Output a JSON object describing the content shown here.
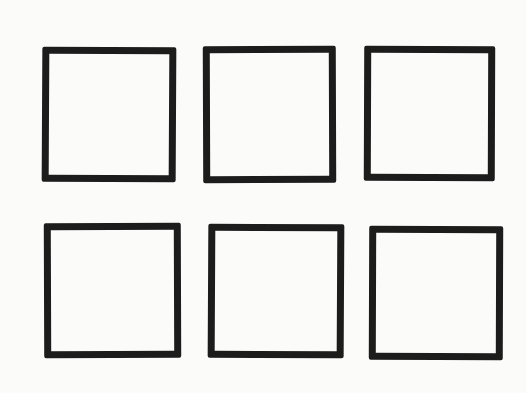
{
  "diagram": {
    "stroke_color": "#1c1c1c",
    "background_color": "#fbfbf9",
    "rows": 2,
    "columns": 3,
    "boxes": [
      {
        "row": 1,
        "col": 1,
        "x": 42,
        "y": 47,
        "w": 134,
        "h": 135
      },
      {
        "row": 1,
        "col": 2,
        "x": 203,
        "y": 46,
        "w": 133,
        "h": 137
      },
      {
        "row": 1,
        "col": 3,
        "x": 364,
        "y": 46,
        "w": 131,
        "h": 135
      },
      {
        "row": 2,
        "col": 1,
        "x": 44,
        "y": 223,
        "w": 137,
        "h": 135
      },
      {
        "row": 2,
        "col": 2,
        "x": 208,
        "y": 224,
        "w": 136,
        "h": 134
      },
      {
        "row": 2,
        "col": 3,
        "x": 369,
        "y": 226,
        "w": 134,
        "h": 134
      }
    ]
  }
}
